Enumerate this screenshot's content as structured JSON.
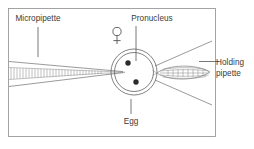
{
  "figure": {
    "background_color": "#ffffff",
    "frame_color": "#9a9a9a",
    "line_color": "#6e6e6e",
    "text_color": "#3a3a3a",
    "nucleus_color": "#2b2b2b",
    "width": 254,
    "height": 149
  },
  "labels": {
    "micropipette": "Micropipette",
    "pronucleus": "Pronucleus",
    "egg": "Egg",
    "holding_pipette_line1": "Holding",
    "holding_pipette_line2": "pipette",
    "female_symbol": "♀"
  },
  "diagram_data": {
    "type": "diagram",
    "frame": {
      "x": 8,
      "y": 8,
      "width": 208,
      "height": 129
    },
    "egg": {
      "center_x": 134,
      "center_y": 72,
      "outer_radius": 23,
      "inner_radius": 19.5,
      "pronuclei": [
        {
          "x": 128,
          "y": 63,
          "radius": 2.7
        },
        {
          "x": 136,
          "y": 82,
          "radius": 2.7
        }
      ]
    },
    "micropipette": {
      "side": "left",
      "tip_x": 123,
      "tip_y": 72,
      "base_x": 10,
      "base_top_y": 61,
      "base_bottom_y": 86,
      "hatch_count": 34
    },
    "holding_pipette": {
      "side": "right",
      "tip_x": 158,
      "center_y": 73,
      "tail_x": 212,
      "half_height": 8,
      "hatch_rows": 5
    },
    "leaders": [
      {
        "name": "micropipette-leader",
        "x1": 38,
        "y1": 26,
        "x2": 38,
        "y2": 56
      },
      {
        "name": "pronucleus-leader",
        "x1": 134,
        "y1": 25,
        "x2": 134,
        "y2": 62
      },
      {
        "name": "egg-leader",
        "x1": 134,
        "y1": 100,
        "x2": 134,
        "y2": 115
      },
      {
        "name": "holding-pipette-leader",
        "x1": 198,
        "y1": 62,
        "x2": 218,
        "y2": 62
      }
    ]
  }
}
